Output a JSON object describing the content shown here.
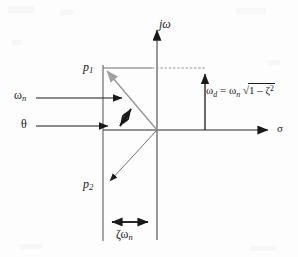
{
  "figure": {
    "kind": "s-plane-pole-zero-diagram",
    "background_color": "#fdfdfd",
    "ink_color": "#1a1a1a",
    "accent_gray": "#8c8c8c"
  },
  "axes": {
    "vertical_label": "jω",
    "vertical_name": "imaginary-axis",
    "horizontal_label": "σ",
    "horizontal_name": "real-axis",
    "origin": {
      "x": 157,
      "y": 130
    }
  },
  "poles": [
    {
      "label_base": "p",
      "label_sub": "1",
      "name": "pole-p1",
      "x": 103,
      "y": 68,
      "vector_color": "#8c8c8c"
    },
    {
      "label_base": "p",
      "label_sub": "2",
      "name": "pole-p2",
      "x": 103,
      "y": 185,
      "vector_color": "#1a1a1a"
    }
  ],
  "annotations": {
    "omega_n": {
      "base": "ω",
      "sub": "n",
      "description": "natural-frequency-vector-magnitude"
    },
    "theta": {
      "symbol": "θ",
      "description": "damping-angle"
    },
    "zeta_omega_n": {
      "text": "ζω",
      "sub": "n",
      "description": "real-part-magnitude"
    },
    "omega_d_equation": {
      "lhs_base": "ω",
      "lhs_sub": "d",
      "equals": "=",
      "rhs_base": "ω",
      "rhs_sub": "n",
      "radical": "√",
      "radicand": "1 – ζ",
      "exponent": "2",
      "full_text": "ωd = ωn √(1 – ζ²)",
      "description": "damped-natural-frequency"
    }
  },
  "dimension_lines": {
    "zeta_omega_n": {
      "y": 222,
      "x_start": 103,
      "x_end": 157
    },
    "omega_d": {
      "x": 205,
      "y_start": 130,
      "y_end": 68
    }
  }
}
